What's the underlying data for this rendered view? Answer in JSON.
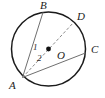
{
  "figure": {
    "type": "circle-geometry-diagram",
    "width": 105,
    "height": 98,
    "background_color": "#ffffff",
    "stroke_color": "#1b1b1b",
    "chord_color": "#6f6f6f",
    "dashed_color": "#8a8a8a",
    "circle": {
      "center_label": "O",
      "center_x": 48.5,
      "center_y": 49,
      "radius": 37
    },
    "points": [
      {
        "label": "A",
        "x": 22.5,
        "y": 77.5,
        "label_x": 9,
        "label_y": 80
      },
      {
        "label": "B",
        "x": 43.0,
        "y": 12.3,
        "label_x": 40,
        "label_y": 0
      },
      {
        "label": "C",
        "x": 85.4,
        "y": 53.0,
        "label_x": 91,
        "label_y": 44
      },
      {
        "label": "D",
        "x": 74.0,
        "y": 22.0,
        "label_x": 77,
        "label_y": 11
      },
      {
        "label": "O",
        "x": 48.5,
        "y": 49.0,
        "label_x": 57,
        "label_y": 50
      }
    ],
    "segments": [
      {
        "name": "chord-a-b",
        "from": "A",
        "to": "B",
        "style": "solid"
      },
      {
        "name": "chord-a-c",
        "from": "A",
        "to": "C",
        "style": "solid"
      },
      {
        "name": "chord-a-d",
        "from": "A",
        "to": "D",
        "style": "dashed"
      }
    ],
    "angle_labels": [
      {
        "label": "1",
        "x": 33,
        "y": 43
      },
      {
        "label": "2",
        "x": 37,
        "y": 54
      }
    ],
    "center_dot": {
      "x": 48.5,
      "y": 49,
      "radius": 2.4,
      "color": "#111111"
    }
  }
}
